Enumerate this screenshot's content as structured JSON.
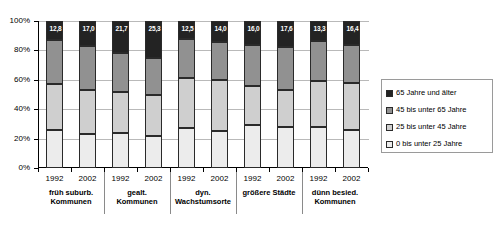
{
  "chart_data": {
    "type": "bar",
    "subtype": "stacked-percent",
    "title": "",
    "subtitle": "",
    "xlabel": "",
    "ylabel": "",
    "ylim": [
      0,
      100
    ],
    "ytick_labels": [
      "0%",
      "20%",
      "40%",
      "60%",
      "80%",
      "100%"
    ],
    "ytick_values": [
      0,
      20,
      40,
      60,
      80,
      100
    ],
    "grid": true,
    "legend_position": "right",
    "legend": [
      "65 Jahre und älter",
      "45 bis unter 65 Jahre",
      "25 bis unter 45 Jahre",
      "0 bis unter 25 Jahre"
    ],
    "colors": {
      "65 Jahre und älter": "#232323",
      "45 bis unter 65 Jahre": "#919191",
      "25 bis unter 45 Jahre": "#cfcfcf",
      "0 bis unter 25 Jahre": "#ececec"
    },
    "groups": [
      {
        "label_line1": "früh suburb.",
        "label_line2": "Kommunen",
        "bars": [
          {
            "year": "1992",
            "values": [
              26.0,
              31.0,
              30.2,
              12.8
            ],
            "top_label": "12,8"
          },
          {
            "year": "2002",
            "values": [
              23.0,
              30.0,
              30.0,
              17.0
            ],
            "top_label": "17,0"
          }
        ]
      },
      {
        "label_line1": "gealt.",
        "label_line2": "Kommunen",
        "bars": [
          {
            "year": "1992",
            "values": [
              24.0,
              28.0,
              26.3,
              21.7
            ],
            "top_label": "21,7"
          },
          {
            "year": "2002",
            "values": [
              22.0,
              28.0,
              24.7,
              25.3
            ],
            "top_label": "25,3"
          }
        ]
      },
      {
        "label_line1": "dyn.",
        "label_line2": "Wachstumsorte",
        "bars": [
          {
            "year": "1992",
            "values": [
              27.0,
              34.0,
              26.5,
              12.5
            ],
            "top_label": "12,5"
          },
          {
            "year": "2002",
            "values": [
              25.0,
              35.0,
              26.0,
              14.0
            ],
            "top_label": "14,0"
          }
        ]
      },
      {
        "label_line1": "größere Städte",
        "label_line2": "",
        "bars": [
          {
            "year": "1992",
            "values": [
              29.0,
              27.0,
              28.0,
              16.0
            ],
            "top_label": "16,0"
          },
          {
            "year": "2002",
            "values": [
              28.0,
              25.0,
              29.4,
              17.6
            ],
            "top_label": "17,6"
          }
        ]
      },
      {
        "label_line1": "dünn besied.",
        "label_line2": "Kommunen",
        "bars": [
          {
            "year": "1992",
            "values": [
              28.0,
              31.0,
              27.7,
              13.3
            ],
            "top_label": "13,3"
          },
          {
            "year": "2002",
            "values": [
              26.0,
              32.0,
              25.6,
              16.4
            ],
            "top_label": "16,4"
          }
        ]
      }
    ]
  }
}
